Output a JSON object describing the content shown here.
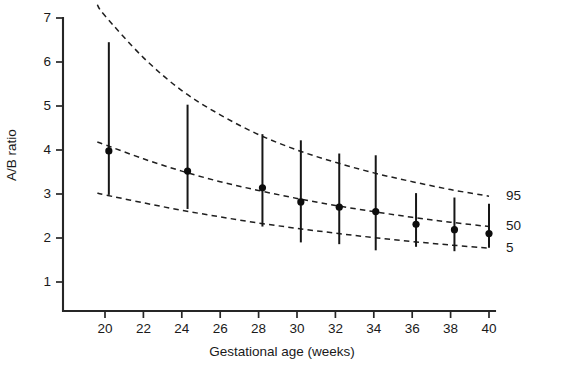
{
  "chart_data": {
    "type": "scatter",
    "title": "",
    "xlabel": "Gestational age (weeks)",
    "ylabel": "A/B ratio",
    "xlim": [
      18.6,
      41.2
    ],
    "ylim": [
      0.55,
      7.35
    ],
    "grid": false,
    "legend_position": "right-inline",
    "x_ticks": [
      20,
      22,
      24,
      26,
      28,
      30,
      32,
      34,
      36,
      38,
      40
    ],
    "y_ticks": [
      1,
      2,
      3,
      4,
      5,
      6,
      7
    ],
    "x_tick_labels": [
      "20",
      "22",
      "24",
      "26",
      "28",
      "30",
      "32",
      "34",
      "36",
      "38",
      "40"
    ],
    "y_tick_labels": [
      "1",
      "2",
      "3",
      "4",
      "5",
      "6",
      "7"
    ],
    "curve_labels": [
      "95",
      "50",
      "5"
    ],
    "curves": [
      {
        "name": "95",
        "label": "95",
        "style": "dashed",
        "x": [
          19.6,
          20,
          22,
          24,
          26,
          28,
          30,
          32,
          34,
          36,
          38,
          40
        ],
        "y": [
          7.3,
          7.05,
          6.1,
          5.35,
          4.8,
          4.35,
          4.0,
          3.72,
          3.48,
          3.28,
          3.1,
          2.95
        ]
      },
      {
        "name": "50",
        "label": "50",
        "style": "dashed",
        "x": [
          19.6,
          20,
          22,
          24,
          26,
          28,
          30,
          32,
          34,
          36,
          38,
          40
        ],
        "y": [
          4.18,
          4.12,
          3.8,
          3.52,
          3.28,
          3.08,
          2.9,
          2.74,
          2.6,
          2.47,
          2.36,
          2.26
        ]
      },
      {
        "name": "5",
        "label": "5",
        "style": "dashed",
        "x": [
          19.6,
          20,
          22,
          24,
          26,
          28,
          30,
          32,
          34,
          36,
          38,
          40
        ],
        "y": [
          3.02,
          2.98,
          2.8,
          2.63,
          2.48,
          2.34,
          2.22,
          2.11,
          2.01,
          1.92,
          1.84,
          1.77
        ]
      }
    ],
    "series": [
      {
        "name": "Observed median with range",
        "marker": "filled-circle",
        "points": [
          {
            "x": 20.2,
            "y": 3.98,
            "low": 2.98,
            "high": 6.45
          },
          {
            "x": 24.3,
            "y": 3.52,
            "low": 2.66,
            "high": 5.03
          },
          {
            "x": 28.2,
            "y": 3.14,
            "low": 2.26,
            "high": 4.36
          },
          {
            "x": 30.2,
            "y": 2.82,
            "low": 1.9,
            "high": 4.22
          },
          {
            "x": 32.2,
            "y": 2.7,
            "low": 1.86,
            "high": 3.92
          },
          {
            "x": 34.1,
            "y": 2.6,
            "low": 1.72,
            "high": 3.88
          },
          {
            "x": 36.2,
            "y": 2.31,
            "low": 1.8,
            "high": 3.02
          },
          {
            "x": 38.2,
            "y": 2.19,
            "low": 1.7,
            "high": 2.92
          },
          {
            "x": 40.0,
            "y": 2.1,
            "low": 1.78,
            "high": 2.78
          }
        ]
      }
    ]
  },
  "colors": {
    "axis": "#262626",
    "curve": "#1f1f1f",
    "marker": "#0d0d0d",
    "background": "#ffffff"
  }
}
